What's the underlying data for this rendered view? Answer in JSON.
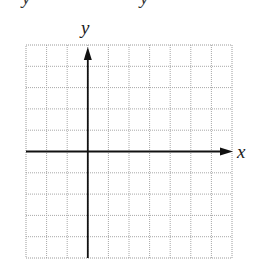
{
  "diagram": {
    "type": "coordinate-grid",
    "columns": 10,
    "rows": 10,
    "y_axis_column": 3,
    "x_axis_row": 5,
    "x_axis_label": "x",
    "y_axis_label": "y",
    "top_cut_text": [
      "y",
      "y"
    ],
    "colors": {
      "grid": "#a8a8a8",
      "axis": "#111111",
      "border": "#9a9a9a"
    }
  }
}
